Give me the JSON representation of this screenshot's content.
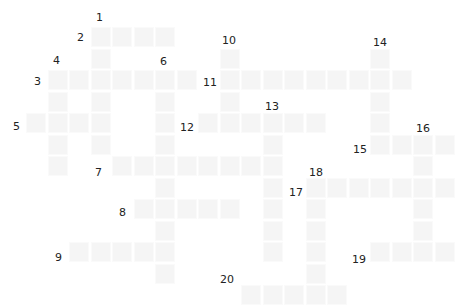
{
  "puzzle": {
    "type": "crossword",
    "cell_size": 21.5,
    "origin": [
      26,
      27
    ],
    "cell_color": "#f5f5f5",
    "words": [
      {
        "num": "1",
        "dir": "down",
        "col": 3,
        "row": 0,
        "len": 6,
        "label_pos": [
          96,
          12
        ]
      },
      {
        "num": "2",
        "dir": "across",
        "col": 3,
        "row": 0,
        "len": 4,
        "label_pos": [
          77,
          32
        ]
      },
      {
        "num": "3",
        "dir": "across",
        "col": 1,
        "row": 2,
        "len": 7,
        "label_pos": [
          34,
          76
        ]
      },
      {
        "num": "4",
        "dir": "down",
        "col": 1,
        "row": 2,
        "len": 5,
        "label_pos": [
          53,
          55
        ]
      },
      {
        "num": "5",
        "dir": "across",
        "col": 0,
        "row": 4,
        "len": 4,
        "label_pos": [
          13,
          121
        ]
      },
      {
        "num": "6",
        "dir": "down",
        "col": 6,
        "row": 2,
        "len": 10,
        "label_pos": [
          160,
          56
        ]
      },
      {
        "num": "7",
        "dir": "across",
        "col": 4,
        "row": 6,
        "len": 8,
        "label_pos": [
          95,
          167
        ]
      },
      {
        "num": "8",
        "dir": "across",
        "col": 5,
        "row": 8,
        "len": 5,
        "label_pos": [
          119,
          207
        ]
      },
      {
        "num": "9",
        "dir": "across",
        "col": 2,
        "row": 10,
        "len": 5,
        "label_pos": [
          55,
          252
        ]
      },
      {
        "num": "10",
        "dir": "down",
        "col": 9,
        "row": 1,
        "len": 4,
        "label_pos": [
          222,
          35
        ]
      },
      {
        "num": "11",
        "dir": "across",
        "col": 9,
        "row": 2,
        "len": 9,
        "label_pos": [
          203,
          77
        ]
      },
      {
        "num": "12",
        "dir": "across",
        "col": 8,
        "row": 4,
        "len": 6,
        "label_pos": [
          180,
          122
        ]
      },
      {
        "num": "13",
        "dir": "down",
        "col": 11,
        "row": 4,
        "len": 7,
        "label_pos": [
          265,
          101
        ]
      },
      {
        "num": "14",
        "dir": "down",
        "col": 16,
        "row": 1,
        "len": 5,
        "label_pos": [
          373,
          37
        ]
      },
      {
        "num": "15",
        "dir": "across",
        "col": 16,
        "row": 5,
        "len": 4,
        "label_pos": [
          353,
          144
        ]
      },
      {
        "num": "16",
        "dir": "down",
        "col": 18,
        "row": 5,
        "len": 6,
        "label_pos": [
          416,
          123
        ]
      },
      {
        "num": "17",
        "dir": "across",
        "col": 13,
        "row": 7,
        "len": 7,
        "label_pos": [
          289,
          187
        ]
      },
      {
        "num": "18",
        "dir": "down",
        "col": 13,
        "row": 7,
        "len": 6,
        "label_pos": [
          309,
          167
        ]
      },
      {
        "num": "19",
        "dir": "across",
        "col": 16,
        "row": 10,
        "len": 4,
        "label_pos": [
          352,
          254
        ]
      },
      {
        "num": "20",
        "dir": "across",
        "col": 10,
        "row": 12,
        "len": 5,
        "label_pos": [
          220,
          274
        ]
      }
    ]
  }
}
